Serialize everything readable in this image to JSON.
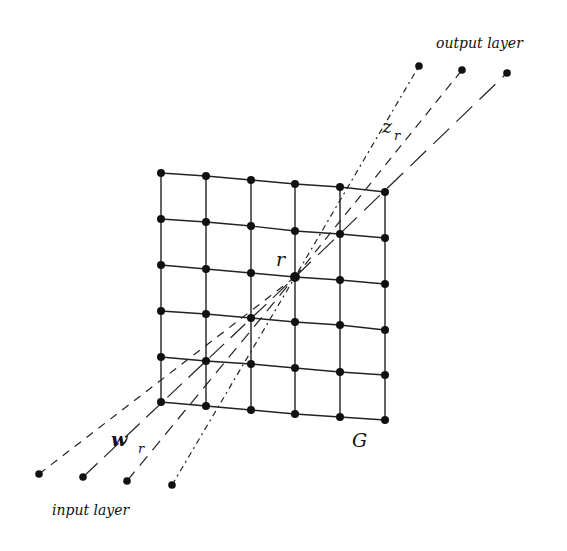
{
  "labels": {
    "output_layer": "output layer",
    "input_layer": "input layer",
    "grid": "G",
    "winner_node": "r",
    "output_weight": {
      "base": "z",
      "sub": "r"
    },
    "input_weight": {
      "base": "w",
      "sub": "r"
    }
  },
  "grid": {
    "rows": 6,
    "cols": 6,
    "nodes": [
      [
        [
          161,
          173
        ],
        [
          206,
          176
        ],
        [
          251,
          180
        ],
        [
          295,
          184
        ],
        [
          340,
          187
        ],
        [
          385,
          192
        ]
      ],
      [
        [
          161,
          219
        ],
        [
          206,
          222
        ],
        [
          251,
          226
        ],
        [
          295,
          231
        ],
        [
          340,
          234
        ],
        [
          385,
          238
        ]
      ],
      [
        [
          161,
          265
        ],
        [
          206,
          269
        ],
        [
          251,
          273
        ],
        [
          295,
          277
        ],
        [
          340,
          280
        ],
        [
          385,
          284
        ]
      ],
      [
        [
          161,
          311
        ],
        [
          206,
          314
        ],
        [
          251,
          318
        ],
        [
          295,
          322
        ],
        [
          340,
          325
        ],
        [
          385,
          330
        ]
      ],
      [
        [
          161,
          357
        ],
        [
          206,
          361
        ],
        [
          251,
          364
        ],
        [
          295,
          368
        ],
        [
          340,
          372
        ],
        [
          385,
          375
        ]
      ],
      [
        [
          161,
          402
        ],
        [
          206,
          406
        ],
        [
          251,
          410
        ],
        [
          295,
          414
        ],
        [
          340,
          417
        ],
        [
          385,
          420
        ]
      ]
    ]
  },
  "winner": {
    "row": 2,
    "col": 3,
    "pos": [
      295,
      277
    ]
  },
  "output_nodes": [
    {
      "pos": [
        419,
        66
      ],
      "dash": "2 4 6 4"
    },
    {
      "pos": [
        462,
        70
      ],
      "dash": "9 7"
    },
    {
      "pos": [
        507,
        73
      ],
      "dash": "22 10"
    }
  ],
  "input_nodes": [
    {
      "pos": [
        39,
        474
      ],
      "dash": "8 7"
    },
    {
      "pos": [
        83,
        477
      ],
      "dash": "20 9"
    },
    {
      "pos": [
        127,
        481
      ],
      "dash": "12 8"
    },
    {
      "pos": [
        172,
        485
      ],
      "dash": "6 4 2 4"
    }
  ],
  "colors": {
    "ink": "#111111",
    "background": "#ffffff"
  }
}
